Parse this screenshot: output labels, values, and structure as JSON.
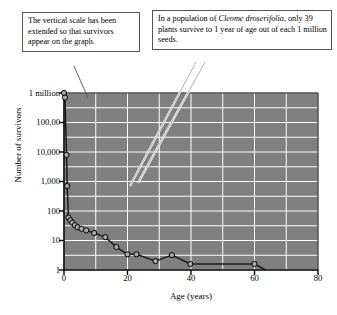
{
  "callouts": [
    {
      "id": "vertical-scale-note",
      "text": "The vertical scale has been extended so that survivors appear on the graph."
    },
    {
      "id": "population-note",
      "lead": "In a population of ",
      "species": "Cleome droserifolia",
      "tail": ", only 39 plants survive to 1 year of age out of each 1 million seeds."
    }
  ],
  "chart_data": {
    "type": "line",
    "title": "",
    "xlabel": "Age (years)",
    "ylabel": "Number of survivors",
    "yscale": "log",
    "ylim": [
      1,
      1000000
    ],
    "xlim": [
      0,
      80
    ],
    "grid": true,
    "legend": "none",
    "ytick_labels": [
      "1 million",
      "100,00",
      "10,000",
      "1,000",
      "100",
      "10",
      "1"
    ],
    "ytick_values": [
      1000000,
      100000,
      10000,
      1000,
      100,
      10,
      1
    ],
    "xtick_labels": [
      "0",
      "20",
      "40",
      "60",
      "80"
    ],
    "xtick_values": [
      0,
      20,
      40,
      60,
      80
    ],
    "series": [
      {
        "name": "Cleome droserifolia survivorship",
        "marker": "open-circle",
        "x": [
          0.0,
          0.3,
          0.8,
          1.0,
          1.4,
          2.0,
          2.6,
          3.4,
          4.3,
          5.5,
          7.0,
          9.5,
          13.0,
          16.5,
          20.0,
          22.8,
          28.8,
          34.0,
          39.8,
          60.0,
          63.5
        ],
        "y": [
          1000000,
          700000,
          8000,
          700,
          60,
          48,
          40,
          33,
          28,
          25,
          22,
          18,
          13,
          6,
          3.4,
          3.4,
          2.0,
          3.2,
          1.6,
          1.6,
          1.0
        ]
      }
    ],
    "colors": {
      "plot_background": "#808080",
      "gridline": "#ffffff",
      "line": "#1a1a1a",
      "marker_fill": "#a8a8a8",
      "marker_stroke": "#000000",
      "axis": "#000000"
    }
  }
}
